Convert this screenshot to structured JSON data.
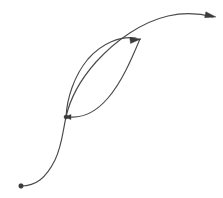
{
  "figure": {
    "background_color": "#ffffff",
    "stroke_color": "#4a4a4a",
    "marker_color": "#3b3b3b",
    "width": 223,
    "height": 198
  },
  "chart_data": {
    "type": "line",
    "title": "",
    "xlabel": "",
    "ylabel": "",
    "xlim": [
      0,
      223
    ],
    "ylim": [
      198,
      0
    ],
    "grid": false,
    "legend": null,
    "axes_visible": false,
    "series": [
      {
        "name": "main-s-curve",
        "style": "solid",
        "color": "#4a4a4a",
        "start_marker": "dot",
        "end_marker": "arrow",
        "path": "M 21 186 C 36 186 46 178 55 160 C 62 146 63 130 66 117 C 70 99 80 80 96 62 C 116 40 142 22 168 16 C 186 12 202 14 213 17",
        "points": [
          [
            21,
            186
          ],
          [
            40,
            183
          ],
          [
            55,
            160
          ],
          [
            66,
            117
          ],
          [
            82,
            82
          ],
          [
            104,
            54
          ],
          [
            134,
            30
          ],
          [
            168,
            16
          ],
          [
            196,
            14
          ],
          [
            213,
            17
          ]
        ]
      },
      {
        "name": "lens-upper-arc",
        "style": "solid",
        "color": "#4a4a4a",
        "start_marker": "none",
        "end_marker": "arrow",
        "path": "M 66 117 C 67 98 74 76 88 59 C 102 43 120 36 136 38",
        "points": [
          [
            66,
            117
          ],
          [
            70,
            95
          ],
          [
            80,
            72
          ],
          [
            96,
            52
          ],
          [
            116,
            40
          ],
          [
            136,
            38
          ]
        ]
      },
      {
        "name": "lens-lower-arc",
        "style": "solid",
        "color": "#4a4a4a",
        "start_marker": "arrow",
        "end_marker": "none",
        "path": "M 70 117 C 84 118 96 112 108 98 C 122 82 132 58 140 39",
        "points": [
          [
            70,
            117
          ],
          [
            86,
            117
          ],
          [
            100,
            106
          ],
          [
            114,
            90
          ],
          [
            128,
            64
          ],
          [
            140,
            39
          ]
        ]
      }
    ],
    "markers": [
      {
        "name": "origin-dot",
        "shape": "dot",
        "x": 21,
        "y": 186,
        "radius": 2.4,
        "color": "#3b3b3b"
      },
      {
        "name": "junction-dot",
        "shape": "dot",
        "x": 66,
        "y": 117,
        "radius": 2.1,
        "color": "#3b3b3b"
      }
    ],
    "arrows": [
      {
        "name": "middle-arrowhead",
        "tip_x": 141,
        "tip_y": 39,
        "angle_deg": -8,
        "length": 11,
        "width": 6,
        "color": "#3b3b3b",
        "direction": "right"
      },
      {
        "name": "end-arrowhead",
        "tip_x": 216,
        "tip_y": 17,
        "angle_deg": 12,
        "length": 11,
        "width": 6,
        "color": "#3b3b3b",
        "direction": "right"
      },
      {
        "name": "junction-arrowhead",
        "tip_x": 64,
        "tip_y": 117,
        "angle_deg": 180,
        "length": 7,
        "width": 5,
        "color": "#3b3b3b",
        "direction": "left"
      }
    ]
  }
}
